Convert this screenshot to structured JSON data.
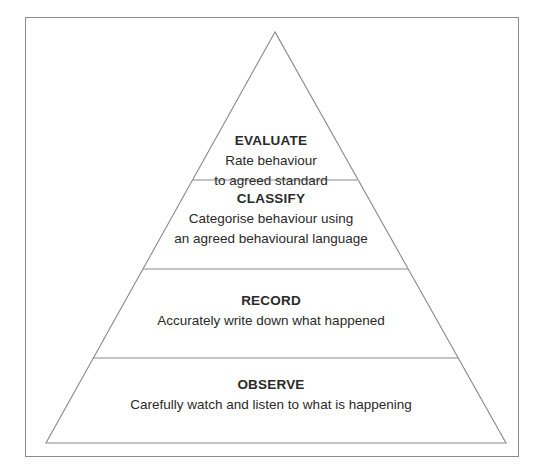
{
  "diagram": {
    "type": "pyramid",
    "tiers": [
      {
        "title": "EVALUATE",
        "lines": [
          "Rate behaviour",
          "to agreed standard"
        ]
      },
      {
        "title": "CLASSIFY",
        "lines": [
          "Categorise behaviour using",
          "an agreed behavioural language"
        ]
      },
      {
        "title": "RECORD",
        "lines": [
          "Accurately write down what happened"
        ]
      },
      {
        "title": "OBSERVE",
        "lines": [
          "Carefully watch and listen to what is happening"
        ]
      }
    ],
    "colors": {
      "line": "#8a8a8a",
      "text": "#2a2a2a",
      "background": "#ffffff"
    }
  }
}
